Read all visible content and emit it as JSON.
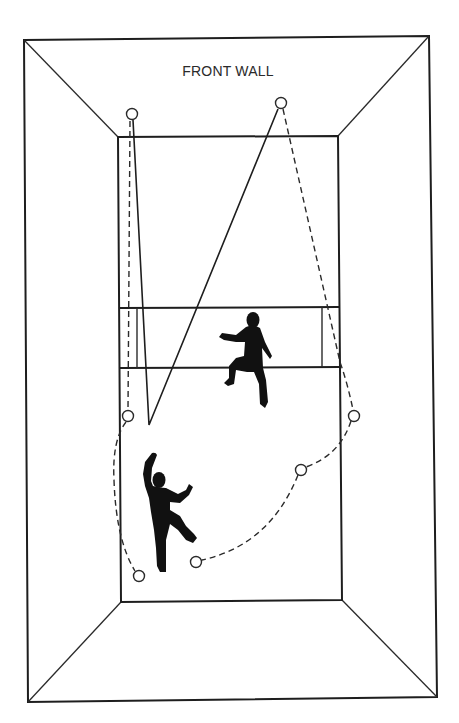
{
  "figure": {
    "title_fragment": "",
    "wall_label": "FRONT WALL",
    "colors": {
      "line": "#1e1e1e",
      "player": "#111111",
      "background": "#ffffff"
    }
  },
  "court": {
    "outer_frame": [
      [
        24,
        40
      ],
      [
        429,
        36
      ],
      [
        437,
        697
      ],
      [
        28,
        702
      ]
    ],
    "floor_rect": [
      [
        118,
        137
      ],
      [
        338,
        136
      ],
      [
        342,
        600
      ],
      [
        121,
        602
      ]
    ],
    "service_line_top_y": 308,
    "short_line_y": 368,
    "service_box_left_x": 137,
    "service_box_right_x": 322
  },
  "shots": {
    "solid_path": [
      [
        132,
        114
      ],
      [
        149,
        425
      ],
      [
        281,
        103
      ]
    ],
    "dashed_left_path": [
      [
        130,
        120
      ],
      [
        128,
        410
      ]
    ],
    "dashed_right_path": [
      [
        281,
        109
      ],
      [
        340,
        365
      ],
      [
        354,
        411
      ]
    ],
    "dashed_lower_path": [
      [
        354,
        416
      ],
      [
        301,
        470
      ],
      [
        196,
        562
      ]
    ],
    "dashed_left_curve": [
      [
        128,
        422
      ],
      [
        115,
        495
      ],
      [
        139,
        576
      ]
    ]
  },
  "bounce_points": [
    {
      "id": "b1",
      "x": 132,
      "y": 114
    },
    {
      "id": "b2",
      "x": 281,
      "y": 103
    },
    {
      "id": "b3",
      "x": 128,
      "y": 416
    },
    {
      "id": "b4",
      "x": 354,
      "y": 416
    },
    {
      "id": "b5",
      "x": 301,
      "y": 470
    },
    {
      "id": "b6",
      "x": 196,
      "y": 562
    },
    {
      "id": "b7",
      "x": 139,
      "y": 576
    }
  ],
  "players": [
    {
      "id": "player-front",
      "position": "center service box"
    },
    {
      "id": "player-back",
      "position": "back left court"
    }
  ]
}
